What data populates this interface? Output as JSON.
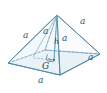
{
  "figure": {
    "type": "square-pyramid-geometry-diagram",
    "title": "",
    "colors": {
      "stroke": "#5b8fa8",
      "stroke_dark": "#3d6e87",
      "base_fill": "#dceaf1",
      "face_fill": "#eef6fa",
      "label": "#2f4f63",
      "background": "#ffffff"
    },
    "labels": {
      "edge_base_front": "a",
      "edge_base_right": "a",
      "edge_slant_left": "a",
      "edge_slant_right": "a",
      "edge_inner_left": "a",
      "edge_inner_right": "a",
      "height": "h",
      "centroid": "G"
    },
    "label_positions": [
      {
        "name": "edge-label-slant-left",
        "text": "a",
        "x": 26,
        "y": 36,
        "style": "lbl-a"
      },
      {
        "name": "edge-label-inner-left",
        "text": "a",
        "x": 45,
        "y": 32,
        "style": "lbl-a"
      },
      {
        "name": "edge-label-inner-right",
        "text": "a",
        "x": 62,
        "y": 38,
        "style": "lbl-a"
      },
      {
        "name": "edge-label-slant-right",
        "text": "a",
        "x": 80,
        "y": 22,
        "style": "lbl-a"
      },
      {
        "name": "edge-label-base-right",
        "text": "a",
        "x": 88,
        "y": 57,
        "style": "lbl-a"
      },
      {
        "name": "edge-label-base-front",
        "text": "a",
        "x": 40,
        "y": 78,
        "style": "lbl-a"
      },
      {
        "name": "height-label",
        "text": "h",
        "x": 55,
        "y": 42,
        "style": "lbl-h"
      },
      {
        "name": "centroid-label",
        "text": "G",
        "x": 44,
        "y": 64,
        "style": "lbl-G"
      }
    ],
    "vertices": {
      "apex": {
        "x": 57,
        "y": 15
      },
      "base_front": {
        "x": 60,
        "y": 75
      },
      "base_left": {
        "x": 8,
        "y": 63
      },
      "base_back": {
        "x": 45,
        "y": 50
      },
      "base_right": {
        "x": 100,
        "y": 54
      },
      "center": {
        "x": 54,
        "y": 56
      }
    },
    "markers": {
      "right_angle_at_center": true,
      "angle_arc_at_center": true,
      "hidden_edge_dashed": true
    }
  }
}
